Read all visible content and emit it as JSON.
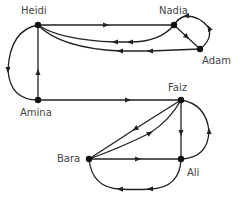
{
  "diagram": {
    "type": "directed-graph",
    "nodes": [
      {
        "id": "heidi",
        "label": "Heidi",
        "x": 38,
        "y": 25
      },
      {
        "id": "nadia",
        "label": "Nadia",
        "x": 174,
        "y": 25
      },
      {
        "id": "adam",
        "label": "Adam",
        "x": 200,
        "y": 49
      },
      {
        "id": "amina",
        "label": "Amina",
        "x": 38,
        "y": 100
      },
      {
        "id": "faiz",
        "label": "Faiz",
        "x": 181,
        "y": 100
      },
      {
        "id": "bara",
        "label": "Bara",
        "x": 89,
        "y": 159
      },
      {
        "id": "ali",
        "label": "Ali",
        "x": 181,
        "y": 159
      }
    ],
    "edges": [
      {
        "from": "heidi",
        "to": "nadia"
      },
      {
        "from": "nadia",
        "to": "heidi"
      },
      {
        "from": "adam",
        "to": "heidi"
      },
      {
        "from": "nadia",
        "to": "adam"
      },
      {
        "from": "adam",
        "to": "nadia"
      },
      {
        "from": "heidi",
        "to": "amina"
      },
      {
        "from": "amina",
        "to": "heidi"
      },
      {
        "from": "amina",
        "to": "faiz"
      },
      {
        "from": "faiz",
        "to": "bara"
      },
      {
        "from": "bara",
        "to": "faiz"
      },
      {
        "from": "faiz",
        "to": "ali"
      },
      {
        "from": "ali",
        "to": "faiz"
      },
      {
        "from": "bara",
        "to": "ali"
      },
      {
        "from": "ali",
        "to": "bara"
      }
    ]
  },
  "labels": {
    "heidi": "Heidi",
    "nadia": "Nadia",
    "adam": "Adam",
    "amina": "Amina",
    "faiz": "Faiz",
    "bara": "Bara",
    "ali": "Ali"
  }
}
